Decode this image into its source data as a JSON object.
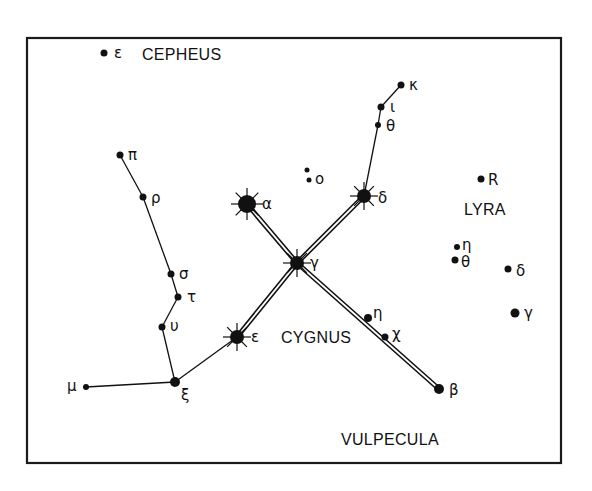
{
  "diagram": {
    "colors": {
      "ink": "#111111",
      "background": "#ffffff"
    },
    "frame": {
      "x": 27,
      "y": 38,
      "width": 534,
      "height": 425
    },
    "constellation_labels": [
      {
        "id": "cepheus",
        "text": "CEPHEUS",
        "x": 142,
        "y": 60
      },
      {
        "id": "lyra",
        "text": "LYRA",
        "x": 464,
        "y": 215
      },
      {
        "id": "cygnus",
        "text": "CYGNUS",
        "x": 281,
        "y": 343
      },
      {
        "id": "vulpecula",
        "text": "VULPECULA",
        "x": 341,
        "y": 445
      }
    ],
    "stars": [
      {
        "id": "cep-epsilon",
        "label": "ε",
        "x": 104,
        "y": 53,
        "r": 3.5,
        "type": "dot",
        "lx": 114,
        "ly": 58
      },
      {
        "id": "cyg-pi",
        "label": "π",
        "x": 120,
        "y": 155,
        "r": 3.5,
        "type": "dot",
        "lx": 128,
        "ly": 160
      },
      {
        "id": "cyg-rho",
        "label": "ρ",
        "x": 143,
        "y": 197,
        "r": 3.5,
        "type": "dot",
        "lx": 151,
        "ly": 203
      },
      {
        "id": "cyg-sigma",
        "label": "σ",
        "x": 171,
        "y": 274,
        "r": 3.5,
        "type": "dot",
        "lx": 179,
        "ly": 279
      },
      {
        "id": "cyg-tau",
        "label": "τ",
        "x": 178,
        "y": 297,
        "r": 3.5,
        "type": "dot",
        "lx": 187,
        "ly": 302
      },
      {
        "id": "cyg-upsilon",
        "label": "υ",
        "x": 162,
        "y": 327,
        "r": 3.5,
        "type": "dot",
        "lx": 170,
        "ly": 331
      },
      {
        "id": "cyg-xi",
        "label": "ξ",
        "x": 175,
        "y": 382,
        "r": 5,
        "type": "dot",
        "lx": 181,
        "ly": 400
      },
      {
        "id": "cyg-mu",
        "label": "μ",
        "x": 86,
        "y": 387,
        "r": 3,
        "type": "dot",
        "lx": 67,
        "ly": 391
      },
      {
        "id": "cyg-epsilon",
        "label": "ε",
        "x": 237,
        "y": 337,
        "r": 7,
        "type": "bright",
        "lx": 251,
        "ly": 342
      },
      {
        "id": "cyg-gamma",
        "label": "γ",
        "x": 297,
        "y": 263,
        "r": 7,
        "type": "bright",
        "lx": 310,
        "ly": 268
      },
      {
        "id": "cyg-alpha",
        "label": "α",
        "x": 247,
        "y": 204,
        "r": 9,
        "type": "bright",
        "lx": 262,
        "ly": 209
      },
      {
        "id": "cyg-delta",
        "label": "δ",
        "x": 364,
        "y": 196,
        "r": 7,
        "type": "bright",
        "lx": 378,
        "ly": 203
      },
      {
        "id": "cyg-theta",
        "label": "θ",
        "x": 378,
        "y": 125,
        "r": 3,
        "type": "dot",
        "lx": 386,
        "ly": 131
      },
      {
        "id": "cyg-iota",
        "label": "ι",
        "x": 381,
        "y": 107,
        "r": 3.5,
        "type": "dot",
        "lx": 390,
        "ly": 112
      },
      {
        "id": "cyg-kappa",
        "label": "κ",
        "x": 401,
        "y": 85,
        "r": 3.5,
        "type": "dot",
        "lx": 409,
        "ly": 90
      },
      {
        "id": "cyg-o1",
        "label": "",
        "x": 307,
        "y": 170,
        "r": 2.5,
        "type": "dot",
        "lx": 0,
        "ly": 0
      },
      {
        "id": "cyg-o2",
        "label": "o",
        "x": 309,
        "y": 180,
        "r": 2.5,
        "type": "dot",
        "lx": 315,
        "ly": 184
      },
      {
        "id": "cyg-eta",
        "label": "η",
        "x": 368,
        "y": 318,
        "r": 4,
        "type": "dot",
        "lx": 373,
        "ly": 318
      },
      {
        "id": "cyg-chi",
        "label": "χ",
        "x": 385,
        "y": 337,
        "r": 3.5,
        "type": "dot",
        "lx": 392,
        "ly": 339
      },
      {
        "id": "cyg-beta",
        "label": "β",
        "x": 439,
        "y": 389,
        "r": 5,
        "type": "dot",
        "lx": 449,
        "ly": 395
      },
      {
        "id": "lyr-r",
        "label": "R",
        "x": 481,
        "y": 179,
        "r": 3.5,
        "type": "dot",
        "lx": 488,
        "ly": 185
      },
      {
        "id": "lyr-eta",
        "label": "η",
        "x": 457,
        "y": 247,
        "r": 3,
        "type": "dot",
        "lx": 462,
        "ly": 250
      },
      {
        "id": "lyr-theta",
        "label": "θ",
        "x": 455,
        "y": 260,
        "r": 3.5,
        "type": "dot",
        "lx": 461,
        "ly": 267
      },
      {
        "id": "lyr-delta",
        "label": "δ",
        "x": 508,
        "y": 269,
        "r": 3.5,
        "type": "dot",
        "lx": 516,
        "ly": 276
      },
      {
        "id": "lyr-gamma",
        "label": "γ",
        "x": 515,
        "y": 313,
        "r": 4.5,
        "type": "dot",
        "lx": 524,
        "ly": 318
      }
    ],
    "single_lines": [
      {
        "from": "cyg-pi",
        "to": "cyg-rho"
      },
      {
        "from": "cyg-rho",
        "to": "cyg-sigma"
      },
      {
        "from": "cyg-sigma",
        "to": "cyg-tau"
      },
      {
        "from": "cyg-tau",
        "to": "cyg-upsilon"
      },
      {
        "from": "cyg-upsilon",
        "to": "cyg-xi"
      },
      {
        "from": "cyg-xi",
        "to": "cyg-mu"
      },
      {
        "from": "cyg-xi",
        "to": "cyg-epsilon"
      },
      {
        "from": "cyg-delta",
        "to": "cyg-theta"
      },
      {
        "from": "cyg-theta",
        "to": "cyg-iota"
      },
      {
        "from": "cyg-iota",
        "to": "cyg-kappa"
      }
    ],
    "double_lines": [
      {
        "from": "cyg-alpha",
        "to": "cyg-gamma"
      },
      {
        "from": "cyg-gamma",
        "to": "cyg-delta"
      },
      {
        "from": "cyg-gamma",
        "to": "cyg-epsilon"
      },
      {
        "from": "cyg-gamma",
        "to": "cyg-beta"
      }
    ]
  }
}
